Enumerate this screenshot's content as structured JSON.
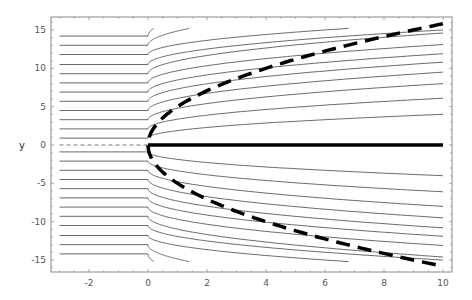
{
  "chart_data": {
    "type": "line",
    "title": "",
    "xlabel": "",
    "ylabel": "y",
    "xlim": [
      -3.3,
      10.3
    ],
    "ylim": [
      -16.5,
      16.7
    ],
    "xticks": [
      -2,
      0,
      2,
      4,
      6,
      8,
      10
    ],
    "xtick_labels": [
      "-2",
      "0",
      "2",
      "4",
      "6",
      "8",
      "10"
    ],
    "yticks": [
      15,
      10,
      5,
      0,
      -5,
      -10,
      -15
    ],
    "ytick_labels": [
      "15",
      "10",
      "5",
      "0",
      "-5",
      "-10",
      "-15"
    ],
    "grid": false,
    "legend": null,
    "frame": true,
    "series": [
      {
        "name": "streamlines",
        "style": "thin-solid",
        "color": "#444444",
        "description": "Horizontal for x<0 starting at x=-3, bending away from y=0 for x>0 (y ≈ y0 + d*sqrt(x/10)), clipped at |y|≈15.2",
        "x_start": -3,
        "x_end": 10,
        "y_clip": 15.2,
        "lines": [
          {
            "y0": 0.9,
            "y_at_10": 4.0
          },
          {
            "y0": 2.1,
            "y_at_10": 6.1
          },
          {
            "y0": 3.3,
            "y_at_10": 8.0
          },
          {
            "y0": 4.5,
            "y_at_10": 9.5
          },
          {
            "y0": 5.7,
            "y_at_10": 10.8
          },
          {
            "y0": 6.9,
            "y_at_10": 11.9
          },
          {
            "y0": 8.1,
            "y_at_10": 13.1
          },
          {
            "y0": 9.3,
            "y_at_10": 14.6
          },
          {
            "y0": 10.5,
            "y_end_x": 10,
            "y_at_10": 15.0
          },
          {
            "y0": 11.8,
            "x_end": 6.8
          },
          {
            "y0": 13.0,
            "x_end": 1.4
          },
          {
            "y0": 14.2,
            "x_end": 0.2
          }
        ],
        "mirrored": true
      },
      {
        "name": "parabola-boundary",
        "style": "thick-dashed",
        "color": "#000000",
        "equation": "x = y^2 / 25",
        "x": [
          0,
          0.25,
          1,
          2,
          4,
          6,
          8,
          10
        ],
        "y_upper": [
          0,
          2.5,
          5.0,
          7.07,
          10.0,
          12.25,
          14.14,
          15.81
        ],
        "y_lower": [
          0,
          -2.5,
          -5.0,
          -7.07,
          -10.0,
          -12.25,
          -14.14,
          -15.81
        ]
      },
      {
        "name": "axis-ray",
        "style": "thick-solid",
        "color": "#000000",
        "x": [
          0,
          10
        ],
        "y": [
          0,
          0
        ]
      },
      {
        "name": "negative-axis",
        "style": "thin-dashed",
        "color": "#555555",
        "x": [
          -3,
          0
        ],
        "y": [
          0,
          0
        ]
      }
    ]
  }
}
